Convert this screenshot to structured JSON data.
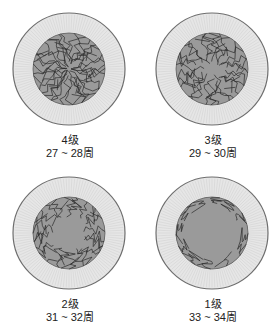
{
  "figure": {
    "colors": {
      "background": "#ffffff",
      "outer_ring_fill": "#e6e6e6",
      "outer_ring_stroke": "#6e6e6e",
      "radial_lines": "#cfcfcf",
      "inner_disc_fill": "#9a9a9a",
      "vessel_lines": "#2a2a2a"
    },
    "panels": [
      {
        "id": "grade-4",
        "grade_label": "4级",
        "weeks_label": "27 ~ 28周",
        "vessel_coverage": 0.95,
        "vessel_count": 34
      },
      {
        "id": "grade-3",
        "grade_label": "3级",
        "weeks_label": "29 ~ 30周",
        "vessel_coverage": 0.72,
        "vessel_count": 28
      },
      {
        "id": "grade-2",
        "grade_label": "2级",
        "weeks_label": "31 ~ 32周",
        "vessel_coverage": 0.5,
        "vessel_count": 22
      },
      {
        "id": "grade-1",
        "grade_label": "1级",
        "weeks_label": "33 ~ 34周",
        "vessel_coverage": 0.22,
        "vessel_count": 12
      }
    ]
  }
}
